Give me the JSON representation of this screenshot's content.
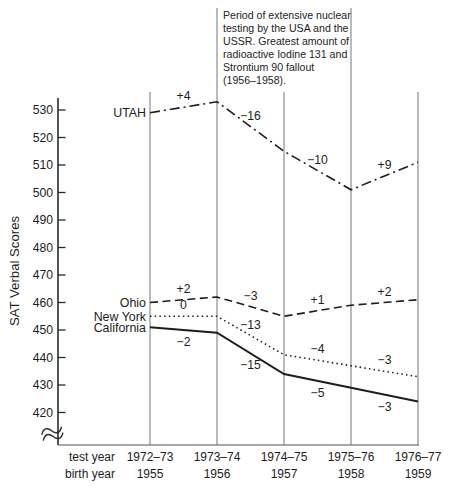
{
  "figure": {
    "annotation": "Period of extensive nuclear\ntesting by the USA and the\nUSSR. Greatest amount of\nradioactive Iodine 131 and\nStrontium 90 fallout\n(1956–1958).",
    "y_axis_title": "SAT Verbal Scores",
    "x_axis": {
      "row1": "test year",
      "row2": "birth year"
    }
  },
  "chart_data": {
    "type": "line",
    "title": "",
    "ylabel": "SAT Verbal Scores",
    "xlabel": "",
    "x_categories_test_year": [
      "1972–73",
      "1973–74",
      "1974–75",
      "1975–76",
      "1976–77"
    ],
    "x_categories_birth_year": [
      "1955",
      "1956",
      "1957",
      "1958",
      "1959"
    ],
    "y_ticks": [
      530,
      520,
      510,
      500,
      490,
      480,
      470,
      460,
      450,
      440,
      430,
      420
    ],
    "ylim": [
      415,
      537
    ],
    "axis_break_at_bottom": true,
    "grid": "vertical line at each test year; lines at 1973–74 and 1975–76 extend to top bounding the annotation",
    "legend_position": "labels at left ends of lines",
    "line_color": "#1d1d1d",
    "annotation": "Period of extensive nuclear testing by the USA and the USSR. Greatest amount of radioactive Iodine 131 and Strontium 90 fallout (1956–1958).",
    "series": [
      {
        "name": "UTAH",
        "line_style": "dash-dot",
        "values": [
          529,
          533,
          515,
          501,
          511
        ],
        "change_labels": [
          "+4",
          "−16",
          "−10",
          "+9"
        ],
        "label_side": "above"
      },
      {
        "name": "Ohio",
        "line_style": "dashed",
        "values": [
          460,
          462,
          455,
          459,
          461
        ],
        "change_labels": [
          "+2",
          "−3",
          "+1",
          "+2"
        ],
        "label_side": "above"
      },
      {
        "name": "New York",
        "line_style": "dotted",
        "values": [
          455,
          455,
          441,
          437,
          433
        ],
        "change_labels": [
          "0",
          "−13",
          "−4",
          "−3"
        ],
        "label_side": "above"
      },
      {
        "name": "California",
        "line_style": "solid",
        "values": [
          451,
          449,
          434,
          429,
          424
        ],
        "change_labels": [
          "−2",
          "−15",
          "−5",
          "−3"
        ],
        "label_side": "below"
      }
    ]
  }
}
